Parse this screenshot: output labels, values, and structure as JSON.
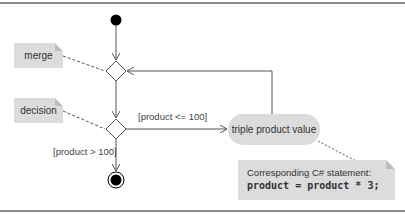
{
  "diagram": {
    "type": "uml-activity",
    "notes": {
      "merge": "merge",
      "decision": "decision",
      "code_label": "Corresponding C# statement:",
      "code_line": "product = product * 3;"
    },
    "action": {
      "label": "triple product value"
    },
    "guards": {
      "loop": "[product <= 100]",
      "exit": "[product > 100]"
    },
    "nodes": [
      "initial",
      "merge",
      "decision",
      "action",
      "final"
    ],
    "colors": {
      "note_fill": "#dcdcdc",
      "line": "#555555",
      "node": "#000000"
    }
  }
}
